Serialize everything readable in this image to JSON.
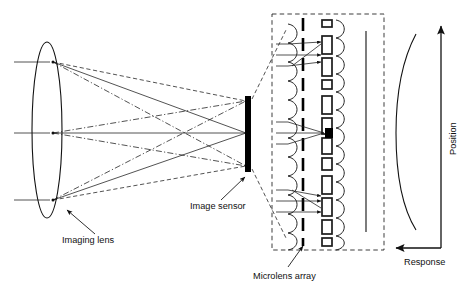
{
  "figure": {
    "background_color": "#ffffff",
    "line_color": "#111111",
    "width": 467,
    "height": 288
  },
  "labels": {
    "imaging_lens": "Imaging lens",
    "image_sensor": "Image sensor",
    "microlens_array": "Microlens array",
    "position_axis": "Position",
    "response_axis": "Response"
  },
  "optics": {
    "lens": {
      "name": "imaging-lens",
      "shape": "ellipse",
      "center_x": 47,
      "center_y": 130,
      "radius_x": 15,
      "radius_y": 88
    },
    "incoming_rays": [
      {
        "label": "top-incoming-ray",
        "y": 62,
        "x_start": 14,
        "x_end": 44
      },
      {
        "label": "middle-incoming-ray",
        "y": 133,
        "x_start": 14,
        "x_end": 44
      },
      {
        "label": "bottom-incoming-ray",
        "y": 200,
        "x_start": 14,
        "x_end": 44
      }
    ],
    "lens_nodes": [
      {
        "name": "top-node",
        "x": 53,
        "y": 62
      },
      {
        "name": "middle-node",
        "x": 53,
        "y": 133
      },
      {
        "name": "bottom-node",
        "x": 53,
        "y": 200
      }
    ],
    "sensor": {
      "name": "image-sensor",
      "x": 248,
      "y_top": 96,
      "y_bottom": 171,
      "thickness": 5,
      "focus_points": [
        {
          "name": "focus-top",
          "x": 248,
          "y": 101
        },
        {
          "name": "focus-middle",
          "x": 248,
          "y": 133
        },
        {
          "name": "focus-bottom",
          "x": 248,
          "y": 166
        }
      ]
    },
    "ray_styles": [
      "dashed",
      "solid",
      "dash-dot"
    ]
  },
  "detail_box": {
    "name": "microlens-detail-box",
    "x": 272,
    "y": 14,
    "width": 112,
    "height": 236,
    "mask_line_x": 303,
    "sensor_plane_x": 366,
    "groups": [
      {
        "name": "microlens-group-top",
        "center_y": 57,
        "ray_mode": "spread"
      },
      {
        "name": "microlens-group-middle",
        "center_y": 133,
        "ray_mode": "converged"
      },
      {
        "name": "microlens-group-bottom",
        "center_y": 203,
        "ray_mode": "spread"
      }
    ],
    "microlens_bump_count": 12
  },
  "response_plot": {
    "name": "response-position-plot",
    "vertical_axis": {
      "x": 441,
      "y_bottom": 248,
      "y_top": 25,
      "arrow": "up"
    },
    "horizontal_axis": {
      "y": 248,
      "x_right": 441,
      "x_left": 393,
      "arrow": "left"
    },
    "curve": {
      "description": "bowed response curve, concave toward the axis",
      "points": [
        [
          415,
          35
        ],
        [
          402,
          70
        ],
        [
          397,
          130
        ],
        [
          402,
          190
        ],
        [
          416,
          228
        ]
      ]
    }
  },
  "annotations": [
    {
      "name": "imaging-lens-callout",
      "text_x": 63,
      "text_y": 241,
      "leader_from": [
        92,
        235
      ],
      "leader_to": [
        64,
        208
      ]
    },
    {
      "name": "image-sensor-callout",
      "text_x": 190,
      "text_y": 207,
      "leader_from": [
        222,
        200
      ],
      "leader_to": [
        246,
        176
      ]
    },
    {
      "name": "microlens-array-callout",
      "text_x": 254,
      "text_y": 277,
      "leader_from": [
        288,
        266
      ],
      "leader_to": [
        302,
        245
      ]
    }
  ]
}
